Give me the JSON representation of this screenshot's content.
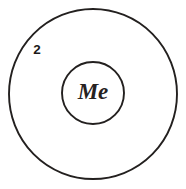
{
  "diagram": {
    "type": "concentric-circles",
    "background_color": "#ffffff",
    "stroke_color": "#23201f",
    "canvas": {
      "width": 186,
      "height": 189
    },
    "outer_circle": {
      "name": "outer-ring",
      "center_x": 93,
      "center_y": 94,
      "radius_x": 84,
      "radius_y": 85,
      "stroke_width": 1.9
    },
    "inner_circle": {
      "name": "core-circle",
      "center_x": 93,
      "center_y": 93,
      "radius_x": 31,
      "radius_y": 31,
      "stroke_width": 1.9
    },
    "labels": {
      "ring_number": {
        "text": "2",
        "x": 37,
        "y": 50,
        "color": "#1b1918"
      },
      "core_text": {
        "text": "Me",
        "x": 93,
        "y": 94,
        "color": "#26221f"
      }
    }
  }
}
